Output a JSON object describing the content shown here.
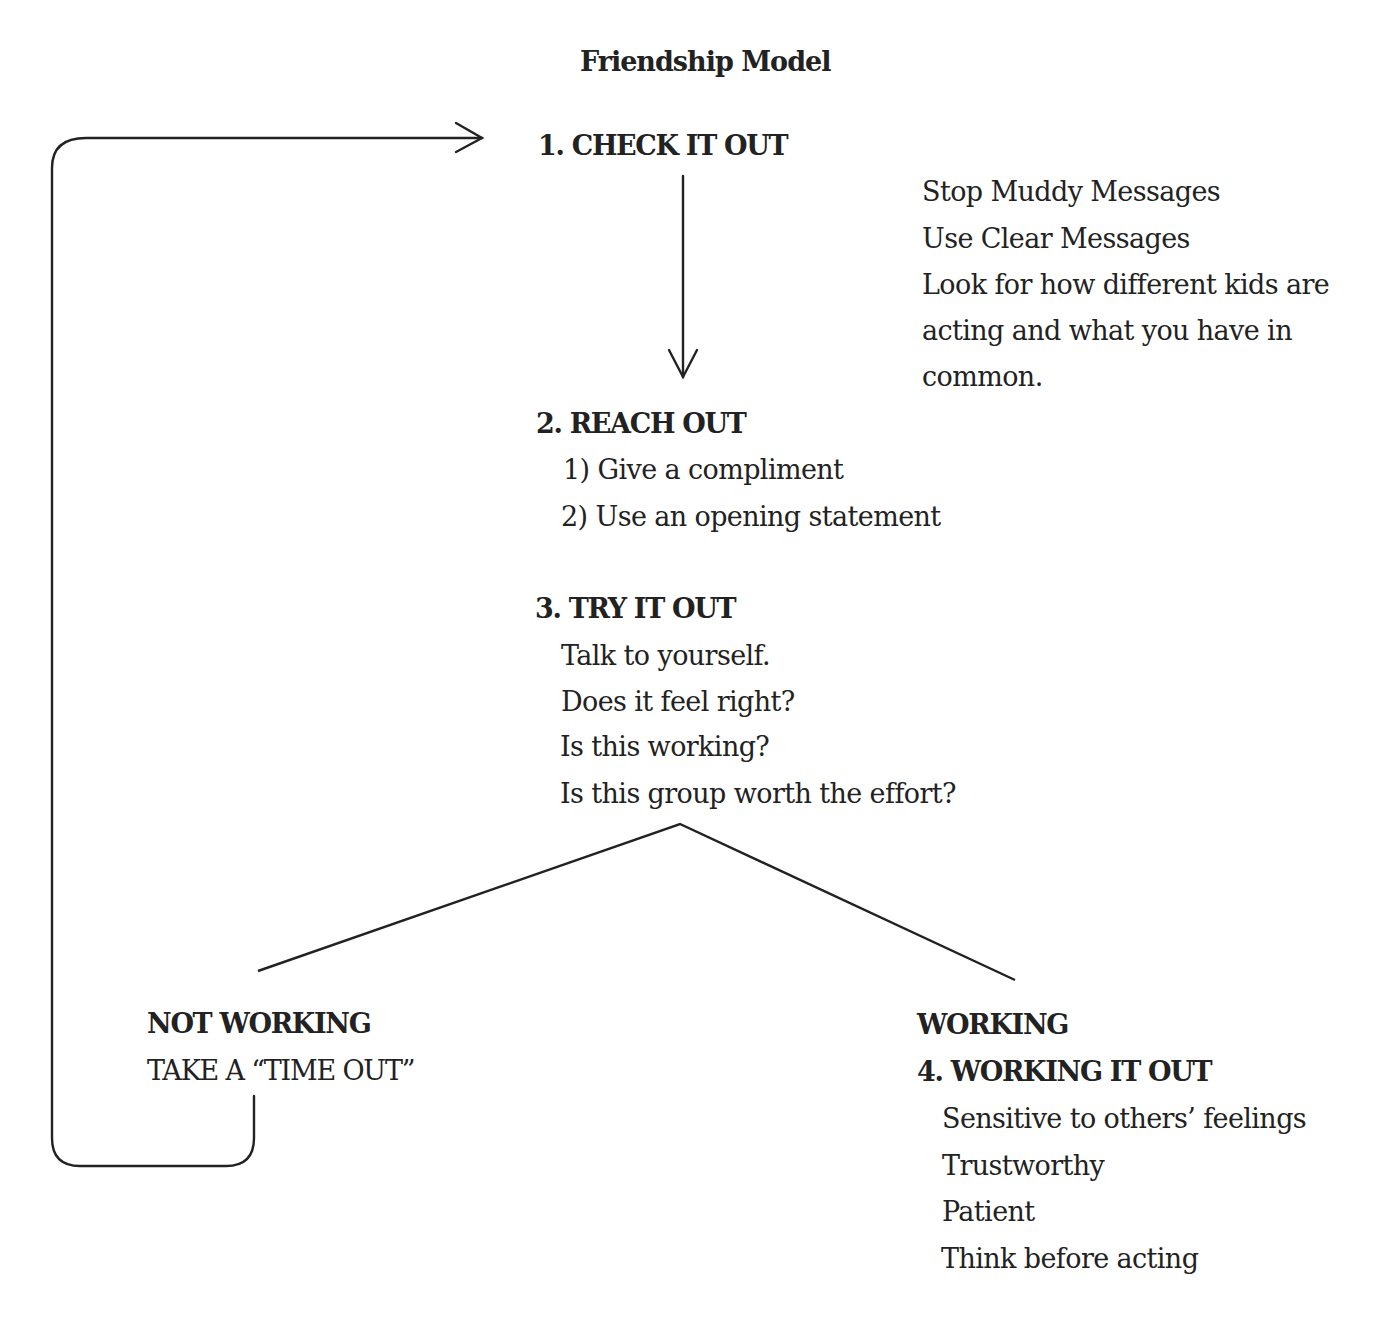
{
  "title": "Friendship Model",
  "steps": {
    "check": {
      "heading": "1. CHECK IT OUT",
      "notes": [
        "Stop Muddy Messages",
        "Use Clear Messages",
        "Look for how different kids are",
        "acting and what you have in",
        "common."
      ]
    },
    "reach": {
      "heading": "2. REACH OUT",
      "items": [
        "1) Give a compliment",
        "2) Use an opening statement"
      ]
    },
    "try": {
      "heading": "3. TRY IT OUT",
      "items": [
        "Talk to yourself.",
        "Does it feel right?",
        "Is this working?",
        "Is this group worth the effort?"
      ]
    },
    "not_working": {
      "heading": "NOT WORKING",
      "action": "TAKE A “TIME OUT”"
    },
    "working": {
      "heading": "WORKING",
      "subheading": "4. WORKING IT OUT",
      "items": [
        "Sensitive to others’ feelings",
        "Trustworthy",
        "Patient",
        "Think before acting"
      ]
    }
  },
  "colors": {
    "ink": "#222222",
    "background": "#ffffff"
  }
}
